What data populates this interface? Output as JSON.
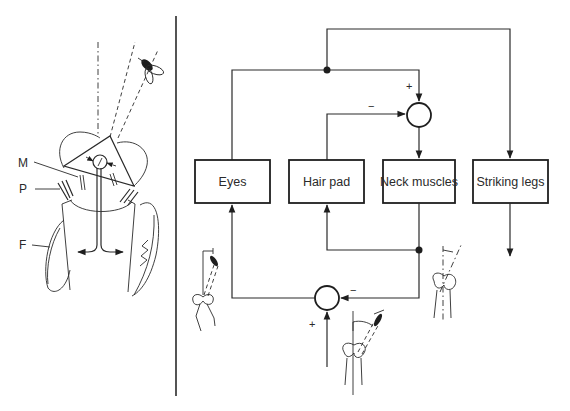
{
  "figure": {
    "left_panel": {
      "description": "Praying mantis head and prothorax with fly target",
      "labels": {
        "m": "M",
        "p": "P",
        "f": "F"
      }
    },
    "right_panel": {
      "blocks": {
        "eyes": "Eyes",
        "hair_pad": "Hair pad",
        "neck_muscles": "Neck muscles",
        "striking_legs": "Striking legs"
      },
      "top_summing_junction": {
        "plus_sign": "+",
        "minus_sign": "−"
      },
      "bottom_summing_junction": {
        "plus_sign": "+",
        "minus_sign": "−"
      }
    }
  }
}
